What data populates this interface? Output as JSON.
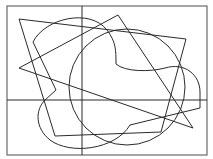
{
  "diagram": {
    "stroke_color": "#2a2a2a",
    "frame_color": "#6a6a6a",
    "background": "#ffffff",
    "frame": {
      "x": 7,
      "y": 6,
      "width": 200,
      "height": 149
    },
    "axes": {
      "vertical": {
        "x": 82,
        "y1": 6,
        "y2": 155
      },
      "horizontal": {
        "y": 100,
        "x1": 7,
        "x2": 207
      }
    },
    "shapes": [
      {
        "name": "quadrilateral",
        "points": "19,19 186,39 161,132 55,136"
      },
      {
        "name": "triangle",
        "points": "19,68 118,15 193,128"
      },
      {
        "name": "circle",
        "cx": 127,
        "cy": 87,
        "r": 58
      },
      {
        "name": "blob",
        "path": "M33,42 C45,18 90,8 107,30 C116,42 116,50 116,64 C125,72 150,72 165,68 C185,62 200,75 200,92 L200,108 L130,125 C115,150 70,155 50,140 C35,128 35,110 45,100 L56,90 Z"
      }
    ]
  }
}
